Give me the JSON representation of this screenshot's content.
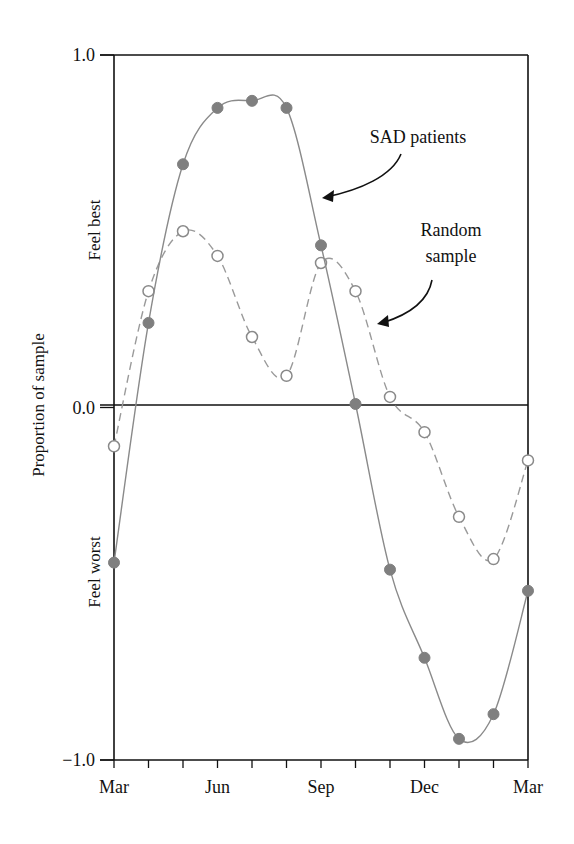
{
  "chart_data": {
    "type": "line",
    "title": "",
    "xlabel": "",
    "ylabel": "Proportion of sample",
    "y_region_labels": {
      "top": "Feel best",
      "bottom": "Feel worst"
    },
    "ylim": [
      -1.0,
      1.0
    ],
    "yticks": [
      {
        "value": 1.0,
        "label": "1.0"
      },
      {
        "value": 0.0,
        "label": "0.0"
      },
      {
        "value": -1.0,
        "label": "−1.0"
      }
    ],
    "x_tick_count": 13,
    "x_major_labels": [
      {
        "index": 0,
        "label": "Mar"
      },
      {
        "index": 3,
        "label": "Jun"
      },
      {
        "index": 6,
        "label": "Sep"
      },
      {
        "index": 9,
        "label": "Dec"
      },
      {
        "index": 12,
        "label": "Mar"
      }
    ],
    "categories": [
      "Mar",
      "Apr",
      "May",
      "Jun",
      "Jul",
      "Aug",
      "Sep",
      "Oct",
      "Nov",
      "Dec",
      "Jan",
      "Feb",
      "Mar"
    ],
    "grid": false,
    "zero_line": true,
    "series": [
      {
        "name": "SAD patients",
        "style": "solid",
        "marker": "filled-circle",
        "color": "#7f7f7f",
        "values": [
          -0.44,
          0.24,
          0.69,
          0.85,
          0.87,
          0.85,
          0.46,
          0.01,
          -0.46,
          -0.71,
          -0.94,
          -0.87,
          -0.52
        ]
      },
      {
        "name": "Random sample",
        "style": "dashed",
        "marker": "open-circle",
        "color": "#8a8a8a",
        "values": [
          -0.11,
          0.33,
          0.5,
          0.43,
          0.2,
          0.09,
          0.41,
          0.33,
          0.03,
          -0.07,
          -0.31,
          -0.43,
          -0.15
        ]
      }
    ],
    "annotations": [
      {
        "text": "SAD patients",
        "lines": [
          "SAD patients"
        ],
        "points_to": "SAD patients"
      },
      {
        "text": "Random sample",
        "lines": [
          "Random",
          "sample"
        ],
        "points_to": "Random sample"
      }
    ]
  }
}
